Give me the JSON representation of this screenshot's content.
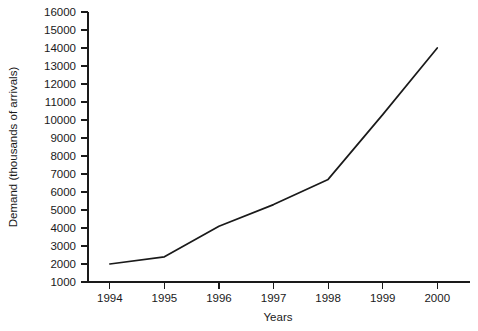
{
  "chart_data": {
    "type": "line",
    "title": "",
    "xlabel": "Years",
    "ylabel": "Demand (thousands of arrivals)",
    "categories": [
      "1994",
      "1995",
      "1996",
      "1997",
      "1998",
      "1999",
      "2000"
    ],
    "x": [
      1994,
      1995,
      1996,
      1997,
      1998,
      1999,
      2000
    ],
    "values": [
      2000,
      2400,
      4100,
      5300,
      6700,
      10300,
      14000
    ],
    "series": [
      {
        "name": "Demand",
        "values": [
          2000,
          2400,
          4100,
          5300,
          6700,
          10300,
          14000
        ],
        "color": "#1a1a1a"
      }
    ],
    "xlim": [
      1993.6,
      2000.6
    ],
    "ylim": [
      1000,
      16000
    ],
    "ytick_labels": [
      "1000",
      "2000",
      "3000",
      "4000",
      "5000",
      "6000",
      "7000",
      "8000",
      "9000",
      "10000",
      "11000",
      "12000",
      "13000",
      "14000",
      "15000",
      "16000"
    ],
    "ytick_values": [
      1000,
      2000,
      3000,
      4000,
      5000,
      6000,
      7000,
      8000,
      9000,
      10000,
      11000,
      12000,
      13000,
      14000,
      15000,
      16000
    ],
    "xtick_labels": [
      "1994",
      "1995",
      "1996",
      "1997",
      "1998",
      "1999",
      "2000"
    ],
    "grid": false,
    "legend": false,
    "legend_position": "none",
    "background_color": "#ffffff",
    "axis_color": "#1a1a1a"
  }
}
